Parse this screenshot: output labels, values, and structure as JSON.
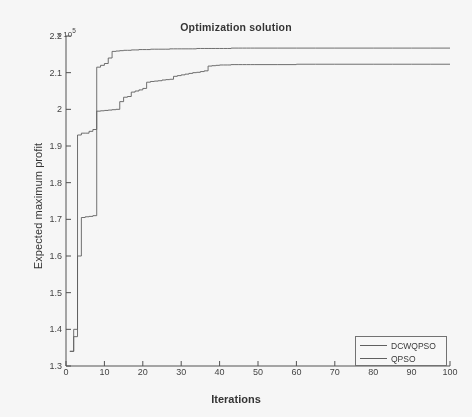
{
  "figure": {
    "title": "Optimization solution",
    "exponent_prefix": "x 10",
    "exponent_power": "5",
    "background_color": "#fefefe",
    "axis_color": "#4a4a4a"
  },
  "axes": {
    "xlabel": "Iterations",
    "ylabel": "Expected maximum profit",
    "xticks": [
      "0",
      "10",
      "20",
      "30",
      "40",
      "50",
      "60",
      "70",
      "80",
      "90",
      "100"
    ],
    "yticks": [
      "1.3",
      "1.4",
      "1.5",
      "1.6",
      "1.7",
      "1.8",
      "1.9",
      "2",
      "2.1",
      "2.2"
    ]
  },
  "legend": {
    "position": "bottom-right",
    "entries": [
      {
        "label": "DCWQPSO",
        "color": "#5a5a5a"
      },
      {
        "label": "QPSO",
        "color": "#5a5a5a"
      }
    ]
  },
  "chart_data": {
    "type": "line",
    "title": "Optimization solution",
    "xlabel": "Iterations",
    "ylabel": "Expected maximum profit",
    "y_axis_multiplier": "x 10^5",
    "xlim": [
      0,
      100
    ],
    "ylim": [
      1.3,
      2.2
    ],
    "grid": false,
    "legend_position": "lower right",
    "x": [
      1,
      2,
      3,
      4,
      5,
      6,
      7,
      8,
      9,
      10,
      11,
      12,
      13,
      14,
      15,
      16,
      17,
      18,
      19,
      20,
      21,
      22,
      23,
      24,
      25,
      26,
      27,
      28,
      29,
      30,
      31,
      32,
      33,
      34,
      35,
      36,
      37,
      38,
      39,
      40,
      41,
      42,
      43,
      44,
      45,
      46,
      47,
      48,
      49,
      50,
      55,
      60,
      65,
      70,
      75,
      80,
      85,
      90,
      95,
      100
    ],
    "series": [
      {
        "name": "DCWQPSO",
        "color": "#5a5a5a",
        "values": [
          1.34,
          1.4,
          1.93,
          1.935,
          1.935,
          1.94,
          1.945,
          2.115,
          2.12,
          2.125,
          2.14,
          2.158,
          2.159,
          2.16,
          2.161,
          2.161,
          2.162,
          2.162,
          2.163,
          2.163,
          2.163,
          2.164,
          2.164,
          2.164,
          2.164,
          2.164,
          2.165,
          2.165,
          2.165,
          2.165,
          2.165,
          2.165,
          2.165,
          2.166,
          2.166,
          2.166,
          2.166,
          2.166,
          2.166,
          2.166,
          2.166,
          2.166,
          2.167,
          2.167,
          2.167,
          2.167,
          2.167,
          2.167,
          2.167,
          2.167,
          2.167,
          2.167,
          2.167,
          2.167,
          2.167,
          2.167,
          2.167,
          2.167,
          2.167,
          2.167
        ]
      },
      {
        "name": "QPSO",
        "color": "#5a5a5a",
        "values": [
          1.34,
          1.38,
          1.6,
          1.705,
          1.707,
          1.708,
          1.71,
          1.995,
          1.996,
          1.997,
          1.998,
          1.999,
          2.0,
          2.021,
          2.033,
          2.035,
          2.047,
          2.05,
          2.053,
          2.057,
          2.074,
          2.076,
          2.077,
          2.078,
          2.08,
          2.081,
          2.082,
          2.09,
          2.092,
          2.094,
          2.096,
          2.098,
          2.1,
          2.101,
          2.103,
          2.105,
          2.118,
          2.119,
          2.12,
          2.121,
          2.121,
          2.121,
          2.122,
          2.122,
          2.122,
          2.122,
          2.122,
          2.122,
          2.122,
          2.122,
          2.122,
          2.123,
          2.123,
          2.123,
          2.123,
          2.123,
          2.123,
          2.123,
          2.123,
          2.123
        ]
      }
    ]
  }
}
